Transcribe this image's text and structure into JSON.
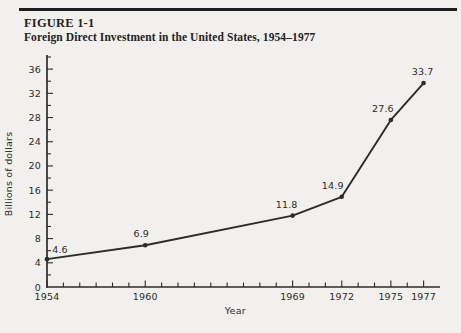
{
  "figure": {
    "label": "FIGURE 1-1",
    "title": "Foreign Direct Investment in the United States, 1954–1977"
  },
  "chart_data": {
    "type": "line",
    "title": "Foreign Direct Investment in the United States, 1954–1977",
    "x": [
      1954,
      1960,
      1969,
      1972,
      1975,
      1977
    ],
    "values": [
      4.6,
      6.9,
      11.8,
      14.9,
      27.6,
      33.7
    ],
    "point_labels": [
      "4.6",
      "6.9",
      "11.8",
      "14.9",
      "27.6",
      "33.7"
    ],
    "xlabel": "Year",
    "ylabel": "Billions of dollars",
    "xlim": [
      1954,
      1978
    ],
    "ylim": [
      0,
      38
    ],
    "x_tick_step": 1,
    "x_labeled_ticks": [
      1954,
      1960,
      1969,
      1972,
      1975,
      1977
    ],
    "y_major_step": 4,
    "y_minor_step": 2,
    "y_labeled_max": 36,
    "y_tick_labels": [
      0,
      4,
      8,
      12,
      16,
      20,
      24,
      28,
      32,
      36
    ],
    "grid": false,
    "legend": false,
    "marker": "filled-dot",
    "line_color": "#2b2b2b"
  },
  "colors": {
    "background": "#f2f0ec",
    "ink": "#2b2b2b"
  }
}
